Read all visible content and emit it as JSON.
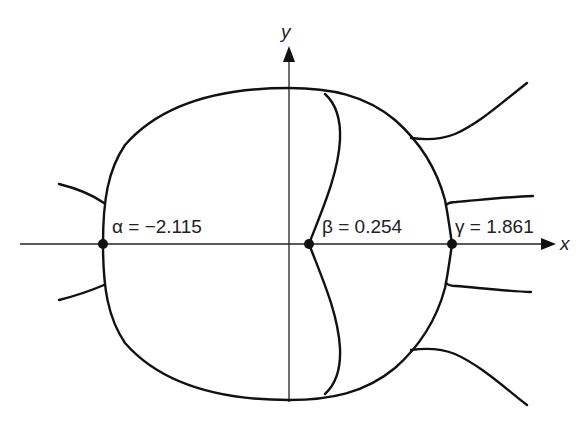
{
  "figure": {
    "axes": {
      "x_label": "x",
      "y_label": "y"
    },
    "points": [
      {
        "name": "alpha",
        "label": "α = −2.115",
        "symbol": "α",
        "value": -2.115
      },
      {
        "name": "beta",
        "label": "β = 0.254",
        "symbol": "β",
        "value": 0.254
      },
      {
        "name": "gamma",
        "label": "γ = 1.861",
        "symbol": "γ",
        "value": 1.861
      }
    ],
    "colors": {
      "stroke": "#111111",
      "background": "#ffffff"
    }
  }
}
